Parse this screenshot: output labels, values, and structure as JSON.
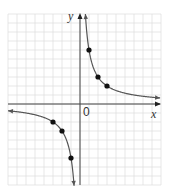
{
  "chart_data": {
    "type": "line",
    "title": "",
    "function": "y = 6/x",
    "xlabel": "x",
    "ylabel": "y",
    "origin_label": "0",
    "grid": true,
    "xlim": [
      -8,
      9
    ],
    "ylim": [
      -9,
      10
    ],
    "series": [
      {
        "name": "branch-positive",
        "x": [
          0.6,
          1,
          2,
          3,
          4,
          5,
          6,
          7,
          8,
          9
        ],
        "y": [
          10,
          6,
          3,
          2,
          1.5,
          1.2,
          1,
          0.857,
          0.75,
          0.667
        ]
      },
      {
        "name": "branch-negative",
        "x": [
          -8,
          -7,
          -6,
          -5,
          -4,
          -3,
          -2,
          -1,
          -0.67
        ],
        "y": [
          -0.75,
          -0.857,
          -1,
          -1.2,
          -1.5,
          -2,
          -3,
          -6,
          -9
        ]
      }
    ],
    "points": [
      {
        "x": 1,
        "y": 6
      },
      {
        "x": 2,
        "y": 3
      },
      {
        "x": 3,
        "y": 2
      },
      {
        "x": -1,
        "y": -6
      },
      {
        "x": -2,
        "y": -3
      },
      {
        "x": -3,
        "y": -2
      }
    ],
    "colors": {
      "curve": "#555555",
      "axis": "#444444",
      "grid": "#dddddd",
      "point": "#111111"
    }
  }
}
